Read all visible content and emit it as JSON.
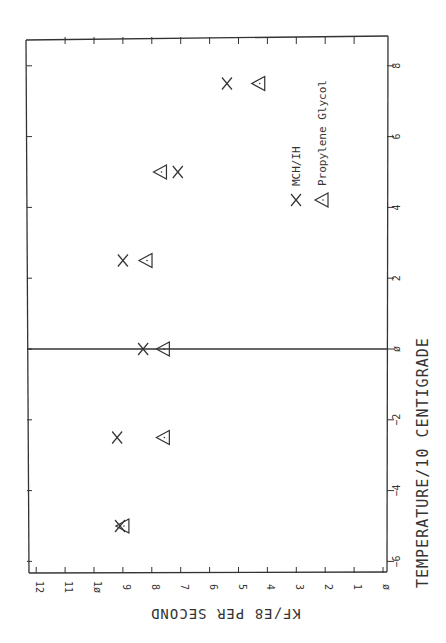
{
  "chart_data": {
    "type": "scatter",
    "orientation": "rotated 90 degrees clockwise (x-axis runs vertically on right, y-axis runs horizontally along bottom)",
    "title": "",
    "xlabel": "TEMPERATURE/10 CENTIGRADE",
    "ylabel": "KF/E8 PER SECOND",
    "xlim": [
      -6,
      9
    ],
    "ylim": [
      0,
      12
    ],
    "x_ticks": [
      -6,
      -4,
      -2,
      0,
      2,
      4,
      6,
      8
    ],
    "y_ticks": [
      0,
      1,
      2,
      3,
      4,
      5,
      6,
      7,
      8,
      9,
      10,
      11,
      12
    ],
    "zero_line": true,
    "grid": false,
    "legend_position": "inside, lower-right region of plot",
    "series": [
      {
        "name": "MCH/IH",
        "marker": "x",
        "points": [
          {
            "x": -5.0,
            "y": 9.1
          },
          {
            "x": -2.5,
            "y": 9.2
          },
          {
            "x": 0.0,
            "y": 8.3
          },
          {
            "x": 2.5,
            "y": 9.0
          },
          {
            "x": 5.0,
            "y": 7.1
          },
          {
            "x": 7.5,
            "y": 5.4
          }
        ]
      },
      {
        "name": "Propylene Glycol",
        "marker": "triangle",
        "points": [
          {
            "x": -5.0,
            "y": 9.0
          },
          {
            "x": -2.5,
            "y": 7.6
          },
          {
            "x": 0.0,
            "y": 7.6
          },
          {
            "x": 2.5,
            "y": 8.2
          },
          {
            "x": 5.0,
            "y": 7.7
          },
          {
            "x": 7.5,
            "y": 4.3
          }
        ]
      }
    ]
  },
  "labels": {
    "xlabel": "TEMPERATURE/10 CENTIGRADE",
    "ylabel": "KF/E8 PER SECOND",
    "legend_mch": "MCH/IH",
    "legend_pg": "Propylene Glycol"
  }
}
